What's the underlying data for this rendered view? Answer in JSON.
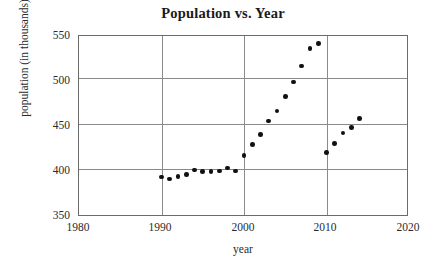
{
  "chart_data": {
    "type": "scatter",
    "title": "Population vs. Year",
    "xlabel": "year",
    "ylabel": "population (in thousands)",
    "xlim": [
      1980,
      2020
    ],
    "ylim": [
      350,
      550
    ],
    "xticks": [
      1980,
      1990,
      2000,
      2010,
      2020
    ],
    "yticks": [
      350,
      400,
      450,
      500,
      550
    ],
    "xtick_labels": [
      "1980",
      "1990",
      "2000",
      "2010",
      "2020"
    ],
    "ytick_labels": [
      "350",
      "400",
      "450",
      "500",
      "550"
    ],
    "grid": "both",
    "legend": "none",
    "marker": "filled-circle",
    "marker_color": "#111111",
    "series": [
      {
        "name": "population",
        "x": [
          1990,
          1991,
          1992,
          1993,
          1994,
          1995,
          1996,
          1997,
          1998,
          1999,
          2000,
          2001,
          2002,
          2003,
          2004,
          2005,
          2006,
          2007,
          2008,
          2009,
          2010,
          2011,
          2012,
          2013,
          2014
        ],
        "values": [
          394,
          392,
          395,
          397,
          402,
          400,
          400,
          401,
          404,
          401,
          418,
          430,
          441,
          456,
          467,
          483,
          499,
          517,
          536,
          542,
          421,
          431,
          443,
          449,
          459
        ]
      }
    ]
  },
  "axes": {
    "grid_color": "#8a8a8a",
    "frame_color": "#6b6b6b"
  }
}
